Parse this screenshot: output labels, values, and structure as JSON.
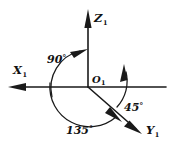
{
  "figure": {
    "background_color": "#ffffff",
    "ink_color": "#1a1a1a",
    "axes": [
      {
        "id": "x-axis",
        "label": "X",
        "subscript": "1",
        "direction": "left",
        "arrowhead": true
      },
      {
        "id": "z-axis",
        "label": "Z",
        "subscript": "1",
        "direction": "up",
        "arrowhead": true
      },
      {
        "id": "y-axis",
        "label": "Y",
        "subscript": "1",
        "direction": "down-right",
        "arrowhead": true
      }
    ],
    "origin": {
      "label": "O",
      "subscript": "1"
    },
    "angles": [
      {
        "id": "angle-90",
        "value": "90",
        "degree_symbol": "°",
        "text": "90°",
        "from_axis": "X",
        "to_axis": "Z",
        "arrowhead": true
      },
      {
        "id": "angle-135",
        "value": "135",
        "degree_symbol": "°",
        "text": "135°",
        "from_axis": "X",
        "to_axis": "Y",
        "arrowhead": true
      },
      {
        "id": "angle-45",
        "value": "45",
        "degree_symbol": "°",
        "text": "45°",
        "from_axis": "Y",
        "to_axis": "Z",
        "arrowhead": true
      }
    ]
  }
}
